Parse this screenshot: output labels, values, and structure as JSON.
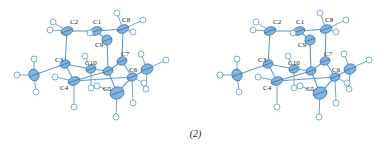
{
  "figure": {
    "caption": "(2)",
    "views": [
      {
        "name": "left-stereo-view",
        "offset_x": 0
      },
      {
        "name": "right-stereo-view",
        "offset_x": 203
      }
    ],
    "atom_labels": [
      "C1",
      "C2",
      "C3",
      "C4",
      "C5",
      "C6",
      "C7",
      "C8",
      "C9",
      "C10"
    ]
  }
}
